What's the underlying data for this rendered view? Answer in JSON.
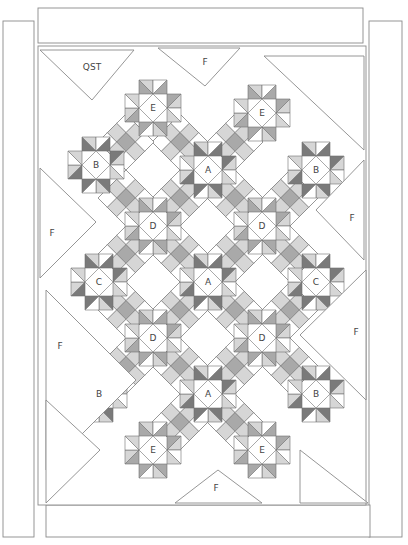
{
  "diagram": {
    "type": "quilt-assembly-diagram",
    "colors": {
      "background": "#ffffff",
      "outline": "#8a8a8a",
      "seam": "#6f6f6f",
      "dark": "#7a7a7a",
      "medium": "#a9a9a9",
      "light": "#d6d6d6",
      "white": "#ffffff",
      "label": "#444444"
    },
    "borders": [
      {
        "name": "top-border",
        "x": 38,
        "y": 8,
        "w": 325,
        "h": 35
      },
      {
        "name": "left-border",
        "x": 3,
        "y": 21,
        "w": 31,
        "h": 516
      },
      {
        "name": "right-border",
        "x": 369,
        "y": 21,
        "w": 33,
        "h": 516
      },
      {
        "name": "bottom-border",
        "x": 46,
        "y": 505,
        "w": 324,
        "h": 32
      }
    ],
    "field": {
      "x": 46,
      "y": 46,
      "w": 320,
      "h": 459
    },
    "grid": {
      "unit": 56,
      "origin_x": 153,
      "origin_y": 108
    },
    "blocks": [
      {
        "label": "E",
        "x": 153,
        "y": 108,
        "kind": "star"
      },
      {
        "label": "E",
        "x": 262,
        "y": 113,
        "kind": "star"
      },
      {
        "label": "B",
        "x": 96,
        "y": 165,
        "kind": "star-dark"
      },
      {
        "label": "A",
        "x": 208,
        "y": 170,
        "kind": "star-dark"
      },
      {
        "label": "B",
        "x": 316,
        "y": 170,
        "kind": "star-dark"
      },
      {
        "label": "D",
        "x": 153,
        "y": 226,
        "kind": "star"
      },
      {
        "label": "D",
        "x": 262,
        "y": 226,
        "kind": "star"
      },
      {
        "label": "C",
        "x": 99,
        "y": 282,
        "kind": "star-dark"
      },
      {
        "label": "A",
        "x": 208,
        "y": 282,
        "kind": "star-dark"
      },
      {
        "label": "C",
        "x": 316,
        "y": 282,
        "kind": "star-dark"
      },
      {
        "label": "D",
        "x": 153,
        "y": 338,
        "kind": "star"
      },
      {
        "label": "D",
        "x": 262,
        "y": 338,
        "kind": "star"
      },
      {
        "label": "B",
        "x": 99,
        "y": 394,
        "kind": "star-dark"
      },
      {
        "label": "A",
        "x": 208,
        "y": 394,
        "kind": "star-dark"
      },
      {
        "label": "B",
        "x": 316,
        "y": 394,
        "kind": "star-dark"
      },
      {
        "label": "E",
        "x": 153,
        "y": 450,
        "kind": "star"
      },
      {
        "label": "E",
        "x": 262,
        "y": 450,
        "kind": "star"
      }
    ],
    "nine_patches": [
      {
        "x": 180,
        "y": 198
      },
      {
        "x": 235,
        "y": 198
      },
      {
        "x": 126,
        "y": 198
      },
      {
        "x": 290,
        "y": 198
      },
      {
        "x": 180,
        "y": 254
      },
      {
        "x": 235,
        "y": 254
      },
      {
        "x": 126,
        "y": 254
      },
      {
        "x": 290,
        "y": 254
      },
      {
        "x": 180,
        "y": 310
      },
      {
        "x": 235,
        "y": 310
      },
      {
        "x": 126,
        "y": 310
      },
      {
        "x": 290,
        "y": 310
      },
      {
        "x": 180,
        "y": 366
      },
      {
        "x": 235,
        "y": 366
      },
      {
        "x": 126,
        "y": 366
      },
      {
        "x": 290,
        "y": 366
      },
      {
        "x": 180,
        "y": 142
      },
      {
        "x": 235,
        "y": 142
      },
      {
        "x": 126,
        "y": 142
      },
      {
        "x": 180,
        "y": 422
      },
      {
        "x": 235,
        "y": 422
      }
    ],
    "setting_triangles": [
      {
        "label": "QST",
        "points": "40,50 134,50 92,100",
        "label_x": 92,
        "label_y": 67
      },
      {
        "label": "F",
        "points": "158,48 240,48 205,86",
        "label_x": 205,
        "label_y": 62
      },
      {
        "label": "",
        "points": "264,56 364,56 364,150",
        "label_x": 0,
        "label_y": 0
      },
      {
        "label": "F",
        "points": "40,168 40,278 96,222",
        "label_x": 52,
        "label_y": 233
      },
      {
        "label": "F",
        "points": "364,160 364,260 316,210",
        "label_x": 352,
        "label_y": 218
      },
      {
        "label": "F",
        "points": "46,290 46,470 136,380",
        "label_x": 60,
        "label_y": 346
      },
      {
        "label": "F",
        "points": "366,270 366,400 300,335",
        "label_x": 356,
        "label_y": 332
      },
      {
        "label": "",
        "points": "46,400 46,503 100,450",
        "label_x": 0,
        "label_y": 0
      },
      {
        "label": "F",
        "points": "175,503 262,503 218,470",
        "label_x": 216,
        "label_y": 488
      },
      {
        "label": "",
        "points": "300,450 368,503 300,503",
        "label_x": 0,
        "label_y": 0
      }
    ]
  }
}
